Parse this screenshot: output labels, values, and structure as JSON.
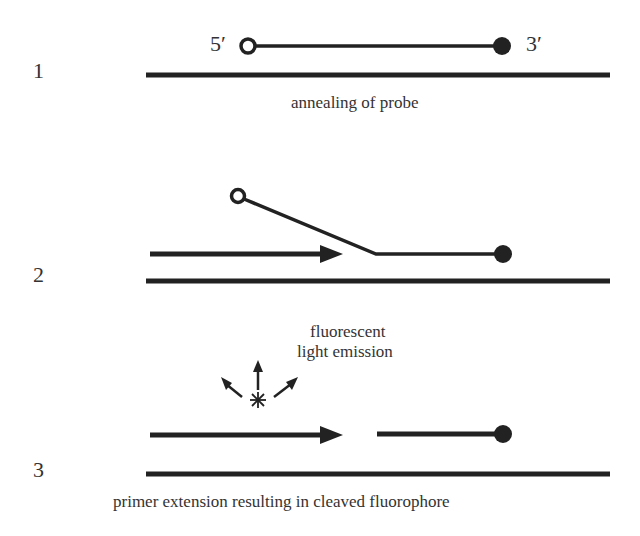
{
  "diagram": {
    "colors": {
      "stroke": "#222222",
      "background": "#ffffff"
    },
    "steps": [
      {
        "number": "1",
        "caption": "annealing of probe",
        "five_prime_label": "5′",
        "three_prime_label": "3′"
      },
      {
        "number": "2",
        "caption": ""
      },
      {
        "number": "3",
        "caption": "primer extension resulting in cleaved fluorophore",
        "emission_label_line1": "fluorescent",
        "emission_label_line2": "light emission"
      }
    ],
    "icons": {
      "reporter": "open-circle-icon",
      "quencher": "filled-circle-icon",
      "primer_direction": "arrow-right-icon",
      "emission": "starburst-icon"
    }
  }
}
